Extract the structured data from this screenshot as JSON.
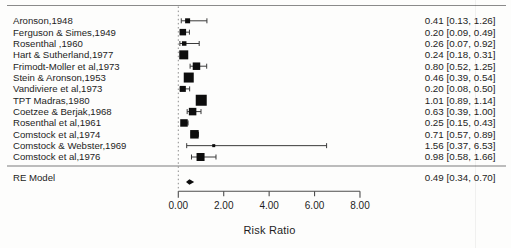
{
  "chart_data": {
    "type": "forest",
    "title": "",
    "xlabel": "Risk Ratio",
    "xlim": [
      0,
      8
    ],
    "x_tick_values": [
      0,
      2,
      4,
      6,
      8
    ],
    "x_tick_labels": [
      "0.00",
      "2.00",
      "4.00",
      "6.00",
      "8.00"
    ],
    "refline": 0,
    "grid": false,
    "legend": false,
    "marker_color": "#0d0d0d",
    "line_color": "#3a3a3a",
    "studies": [
      {
        "label": "Aronson,1948",
        "est": 0.41,
        "lo": 0.13,
        "hi": 1.26,
        "display": "0.41 [0.13, 1.26]",
        "weight": 5
      },
      {
        "label": "Ferguson & Simes,1949",
        "est": 0.2,
        "lo": 0.09,
        "hi": 0.49,
        "display": "0.20 [0.09, 0.49]",
        "weight": 6.5
      },
      {
        "label": "Rosenthal ,1960",
        "est": 0.26,
        "lo": 0.07,
        "hi": 0.92,
        "display": "0.26 [0.07, 0.92]",
        "weight": 4.5
      },
      {
        "label": "Hart & Sutherland,1977",
        "est": 0.24,
        "lo": 0.18,
        "hi": 0.31,
        "display": "0.24 [0.18, 0.31]",
        "weight": 9
      },
      {
        "label": "Frimodt-Moller et al,1973",
        "est": 0.8,
        "lo": 0.52,
        "hi": 1.25,
        "display": "0.80 [0.52, 1.25]",
        "weight": 7.5
      },
      {
        "label": "Stein & Aronson,1953",
        "est": 0.46,
        "lo": 0.39,
        "hi": 0.54,
        "display": "0.46 [0.39, 0.54]",
        "weight": 10
      },
      {
        "label": "Vandiviere et al,1973",
        "est": 0.2,
        "lo": 0.08,
        "hi": 0.5,
        "display": "0.20 [0.08, 0.50]",
        "weight": 6
      },
      {
        "label": "TPT Madras,1980",
        "est": 1.01,
        "lo": 0.89,
        "hi": 1.14,
        "display": "1.01 [0.89, 1.14]",
        "weight": 11
      },
      {
        "label": "Coetzee & Berjak,1968",
        "est": 0.63,
        "lo": 0.39,
        "hi": 1.0,
        "display": "0.63 [0.39, 1.00]",
        "weight": 7.5
      },
      {
        "label": "Rosenthal et al,1961",
        "est": 0.25,
        "lo": 0.15,
        "hi": 0.43,
        "display": "0.25 [0.15, 0.43]",
        "weight": 7.5
      },
      {
        "label": "Comstock et al,1974",
        "est": 0.71,
        "lo": 0.57,
        "hi": 0.89,
        "display": "0.71 [0.57, 0.89]",
        "weight": 8.5
      },
      {
        "label": "Comstock & Webster,1969",
        "est": 1.56,
        "lo": 0.37,
        "hi": 6.53,
        "display": "1.56 [0.37, 6.53]",
        "weight": 3
      },
      {
        "label": "Comstock et al,1976",
        "est": 0.98,
        "lo": 0.58,
        "hi": 1.66,
        "display": "0.98 [0.58, 1.66]",
        "weight": 8
      }
    ],
    "summary": {
      "label": "RE Model",
      "est": 0.49,
      "lo": 0.34,
      "hi": 0.7,
      "display": "0.49 [0.34, 0.70]"
    }
  }
}
